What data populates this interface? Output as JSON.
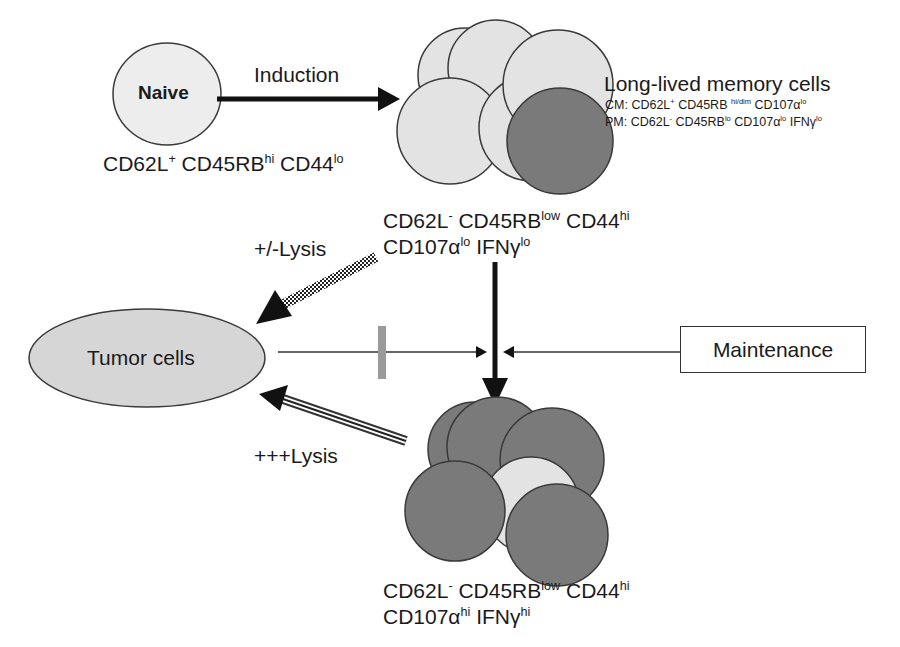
{
  "colors": {
    "light_cell": "#e3e3e3",
    "dark_cell": "#7a7a7a",
    "outline": "#3a3a3a",
    "tumor_fill": "#d6d6d6",
    "inhibit_bar": "#9a9a9a",
    "arrow": "#111111"
  },
  "naive": {
    "label": "Naive",
    "markers": [
      {
        "base": "CD62L",
        "sup": "+"
      },
      {
        "base": " CD45RB",
        "sup": "hi"
      },
      {
        "base": " CD44",
        "sup": "lo"
      }
    ]
  },
  "induction": {
    "label": "Induction"
  },
  "memory": {
    "title": "Long-lived memory cells",
    "cm": [
      {
        "base": "CM: CD62L",
        "sup": "+"
      },
      {
        "base": " CD45RB ",
        "sup": "hi/dim"
      },
      {
        "base": " CD107α",
        "sup": "lo"
      }
    ],
    "pm": [
      {
        "base": "PM: CD62L",
        "sup": "-"
      },
      {
        "base": " CD45RB",
        "sup": "lo"
      },
      {
        "base": " CD107α",
        "sup": "lo"
      },
      {
        "base": " IFNγ",
        "sup": "lo"
      }
    ],
    "phenotype_line1": [
      {
        "base": "CD62L",
        "sup": "-"
      },
      {
        "base": " CD45RB",
        "sup": "low"
      },
      {
        "base": " CD44",
        "sup": "hi"
      }
    ],
    "phenotype_line2": [
      {
        "base": "CD107α",
        "sup": "lo"
      },
      {
        "base": " IFNγ",
        "sup": "lo"
      }
    ]
  },
  "effector": {
    "phenotype_line1": [
      {
        "base": "CD62L",
        "sup": "-"
      },
      {
        "base": " CD45RB",
        "sup": "low"
      },
      {
        "base": " CD44",
        "sup": "hi"
      }
    ],
    "phenotype_line2": [
      {
        "base": "CD107α",
        "sup": "hi"
      },
      {
        "base": " IFNγ",
        "sup": "hi"
      }
    ]
  },
  "tumor": {
    "label": "Tumor cells"
  },
  "weak_lysis": {
    "label": "+/-Lysis"
  },
  "strong_lysis": {
    "label": "+++Lysis"
  },
  "maintenance": {
    "label": "Maintenance"
  }
}
